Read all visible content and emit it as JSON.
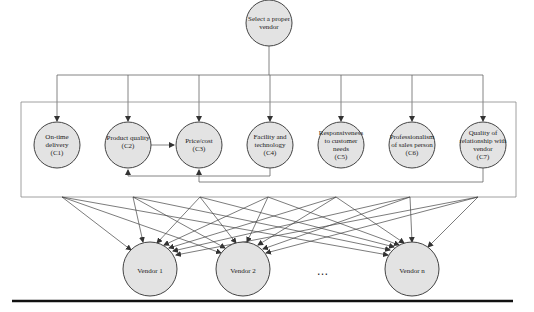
{
  "diagram": {
    "type": "hierarchy",
    "goal": {
      "label": "Select a proper vendor",
      "cx": 269,
      "cy": 23,
      "r": 23
    },
    "criteria": [
      {
        "id": "C1",
        "label": "On-time delivery (C1)",
        "cx": 57,
        "cy": 145
      },
      {
        "id": "C2",
        "label": "Product quality (C2)",
        "cx": 128,
        "cy": 145
      },
      {
        "id": "C3",
        "label": "Price/cost (C3)",
        "cx": 199,
        "cy": 145
      },
      {
        "id": "C4",
        "label": "Facility and technology (C4)",
        "cx": 270,
        "cy": 145
      },
      {
        "id": "C5",
        "label": "Responsiveness to customer needs (C5)",
        "cx": 341,
        "cy": 145
      },
      {
        "id": "C6",
        "label": "Professionalism of sales person (C6)",
        "cx": 412,
        "cy": 145
      },
      {
        "id": "C7",
        "label": "Quality of relationship with vendor (C7)",
        "cx": 483,
        "cy": 145
      }
    ],
    "criteria_radius": 23,
    "alternatives": [
      {
        "label": "Vendor 1",
        "cx": 150,
        "cy": 269
      },
      {
        "label": "Vendor 2",
        "cx": 243,
        "cy": 269
      },
      {
        "label": "Vendor n",
        "cx": 412,
        "cy": 269
      }
    ],
    "alternatives_radius": 27,
    "ellipsis": "…",
    "interdependencies": [
      {
        "from": "C2",
        "to": "C3"
      },
      {
        "from": "C4",
        "to": "C2"
      },
      {
        "from": "C7",
        "to": "C3"
      }
    ],
    "fan_points_x": [
      62,
      133,
      200,
      268,
      336,
      410,
      478
    ],
    "colors": {
      "node_fill": "#e3e3e3",
      "stroke": "#444444",
      "line": "#555555"
    }
  },
  "labels": {
    "goal_line1": "Select a proper",
    "goal_line2": "vendor",
    "c1": [
      "On-time",
      "delivery",
      "(C1)"
    ],
    "c2": [
      "Product quality",
      "(C2)"
    ],
    "c3": [
      "Price/cost",
      "(C3)"
    ],
    "c4": [
      "Facility and",
      "technology",
      "(C4)"
    ],
    "c5": [
      "Responsiveness",
      "to customer",
      "needs",
      "(C5)"
    ],
    "c6": [
      "Professionalism",
      "of sales person",
      "(C6)"
    ],
    "c7": [
      "Quality of",
      "relationship with",
      "vendor",
      "(C7)"
    ],
    "v1": "Vendor 1",
    "v2": "Vendor 2",
    "vn": "Vendor n",
    "ellipsis": "…"
  }
}
